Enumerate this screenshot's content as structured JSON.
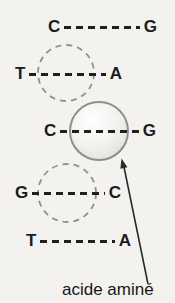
{
  "diagram": {
    "base_pairs": [
      {
        "left": "C",
        "right": "G",
        "highlight": "none"
      },
      {
        "left": "T",
        "right": "A",
        "highlight": "dashed-circle"
      },
      {
        "left": "C",
        "right": "G",
        "highlight": "amino-acid-sphere"
      },
      {
        "left": "G",
        "right": "C",
        "highlight": "dashed-circle"
      },
      {
        "left": "T",
        "right": "A",
        "highlight": "none"
      }
    ],
    "annotation": {
      "label": "acide aminé",
      "points_to": "amino-acid-sphere"
    },
    "colors": {
      "background": "#f4f2ee",
      "text": "#1b1b1b",
      "bond_dashes": "#1f1f1f",
      "dashed_circle": "#909090",
      "sphere_border": "#8e8e8e",
      "sphere_fill": "#f3f2ef",
      "arrow": "#2a2a2a"
    }
  }
}
